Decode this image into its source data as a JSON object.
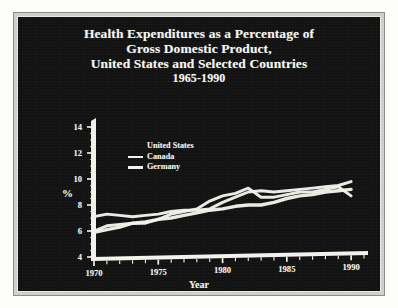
{
  "chart_data": {
    "type": "line",
    "title": "Health Expenditures as a Percentage of Gross Domestic Product, United States and Selected Countries 1965-1990",
    "title_lines": [
      "Health Expenditures as a Percentage of",
      "Gross Domestic Product,",
      "United States and Selected Countries",
      "1965-1990"
    ],
    "xlabel": "Year",
    "ylabel": "%",
    "xlim": [
      1970,
      1991
    ],
    "ylim": [
      4,
      14
    ],
    "yticks": [
      4,
      6,
      8,
      10,
      12,
      14
    ],
    "xticks": [
      1970,
      1975,
      1980,
      1985,
      1990
    ],
    "x_minor_tick_step": 1,
    "grid": false,
    "legend_position": "upper-left-inside",
    "x": [
      1970,
      1971,
      1972,
      1973,
      1974,
      1975,
      1976,
      1977,
      1978,
      1979,
      1980,
      1981,
      1982,
      1983,
      1984,
      1985,
      1986,
      1987,
      1988,
      1989,
      1990
    ],
    "series": [
      {
        "name": "United States",
        "swatch": "none",
        "values": [
          7.1,
          7.3,
          7.2,
          7.1,
          7.2,
          7.3,
          7.5,
          7.6,
          7.6,
          7.7,
          8.2,
          8.6,
          9.0,
          9.1,
          9.0,
          9.1,
          9.2,
          9.3,
          9.4,
          9.5,
          9.8
        ]
      },
      {
        "name": "Canada",
        "swatch": "solid",
        "values": [
          6.0,
          6.4,
          6.5,
          6.6,
          6.6,
          6.9,
          7.3,
          7.5,
          7.7,
          8.3,
          8.7,
          8.9,
          9.3,
          8.6,
          8.6,
          8.8,
          9.0,
          9.0,
          9.2,
          9.4,
          8.7
        ]
      },
      {
        "name": "Germany",
        "swatch": "thick",
        "values": [
          5.9,
          6.1,
          6.3,
          6.6,
          6.7,
          6.9,
          7.0,
          7.2,
          7.4,
          7.6,
          7.7,
          7.9,
          8.0,
          8.0,
          8.2,
          8.5,
          8.7,
          8.8,
          9.0,
          9.1,
          9.2
        ]
      }
    ]
  },
  "source_note": "Source: Organization for Economic Cooperation and Development, Health Data File, 1991.",
  "colors": {
    "card_background": "#131313",
    "ink": "#f2f2ec",
    "frame": "#cfcfcb",
    "page": "#fdfdfb"
  }
}
